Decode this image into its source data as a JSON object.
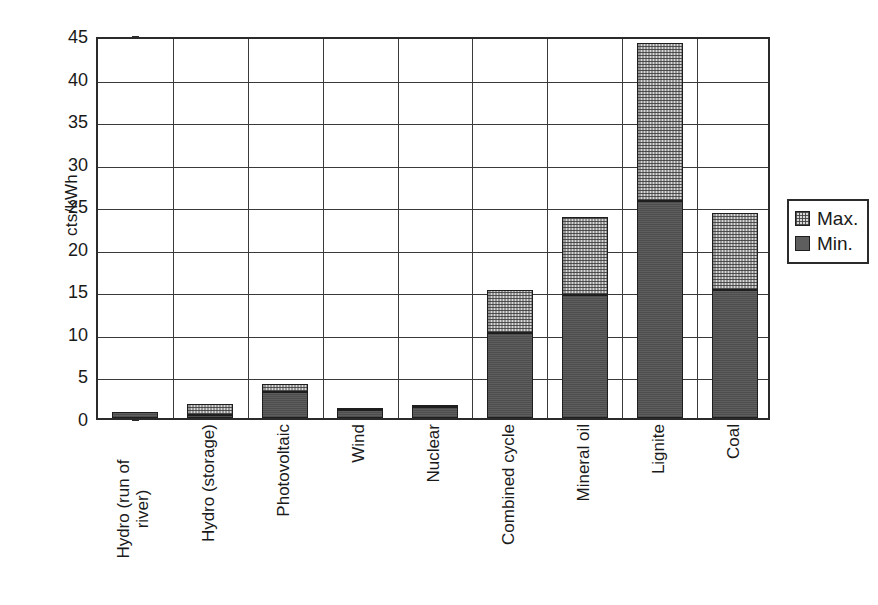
{
  "chart_data": {
    "type": "bar",
    "stacked": true,
    "title": "",
    "subtitle": "",
    "xlabel": "",
    "ylabel": "cts/kWh",
    "ylim": [
      0,
      45
    ],
    "ytick_step": 5,
    "yticks": [
      0,
      5,
      10,
      15,
      20,
      25,
      30,
      35,
      40,
      45
    ],
    "ytick_labels": [
      "0",
      "5",
      "10",
      "15",
      "20",
      "25",
      "30",
      "35",
      "40",
      "45"
    ],
    "grid": "horizontal-and-vertical",
    "legend_position": "right",
    "categories": [
      "Hydro (run of river)",
      "Hydro (storage)",
      "Photovoltaic",
      "Wind",
      "Nuclear",
      "Combined cycle",
      "Mineral oil",
      "Lignite",
      "Coal"
    ],
    "category_label_lines": [
      [
        "Hydro (run of",
        "river)"
      ],
      [
        "Hydro (storage)"
      ],
      [
        "Photovoltaic"
      ],
      [
        "Wind"
      ],
      [
        "Nuclear"
      ],
      [
        "Combined cycle"
      ],
      [
        "Mineral oil"
      ],
      [
        "Lignite"
      ],
      [
        "Coal"
      ]
    ],
    "series": [
      {
        "name": "Min.",
        "color": "#5e5e5e",
        "values": [
          0.7,
          0.3,
          3.0,
          1.0,
          1.3,
          10.0,
          14.4,
          25.5,
          15.0
        ]
      },
      {
        "name": "Max.",
        "color": "#d8d8d8",
        "values": [
          0.7,
          1.7,
          4.0,
          1.2,
          1.4,
          15.0,
          23.6,
          44.1,
          24.1
        ]
      }
    ]
  },
  "axes": {
    "y_title": "cts/kWh"
  },
  "legend": {
    "entries": [
      {
        "label": "Max.",
        "swatch": "checkered-light-swatch"
      },
      {
        "label": "Min.",
        "swatch": "solid-dark-swatch"
      }
    ]
  }
}
